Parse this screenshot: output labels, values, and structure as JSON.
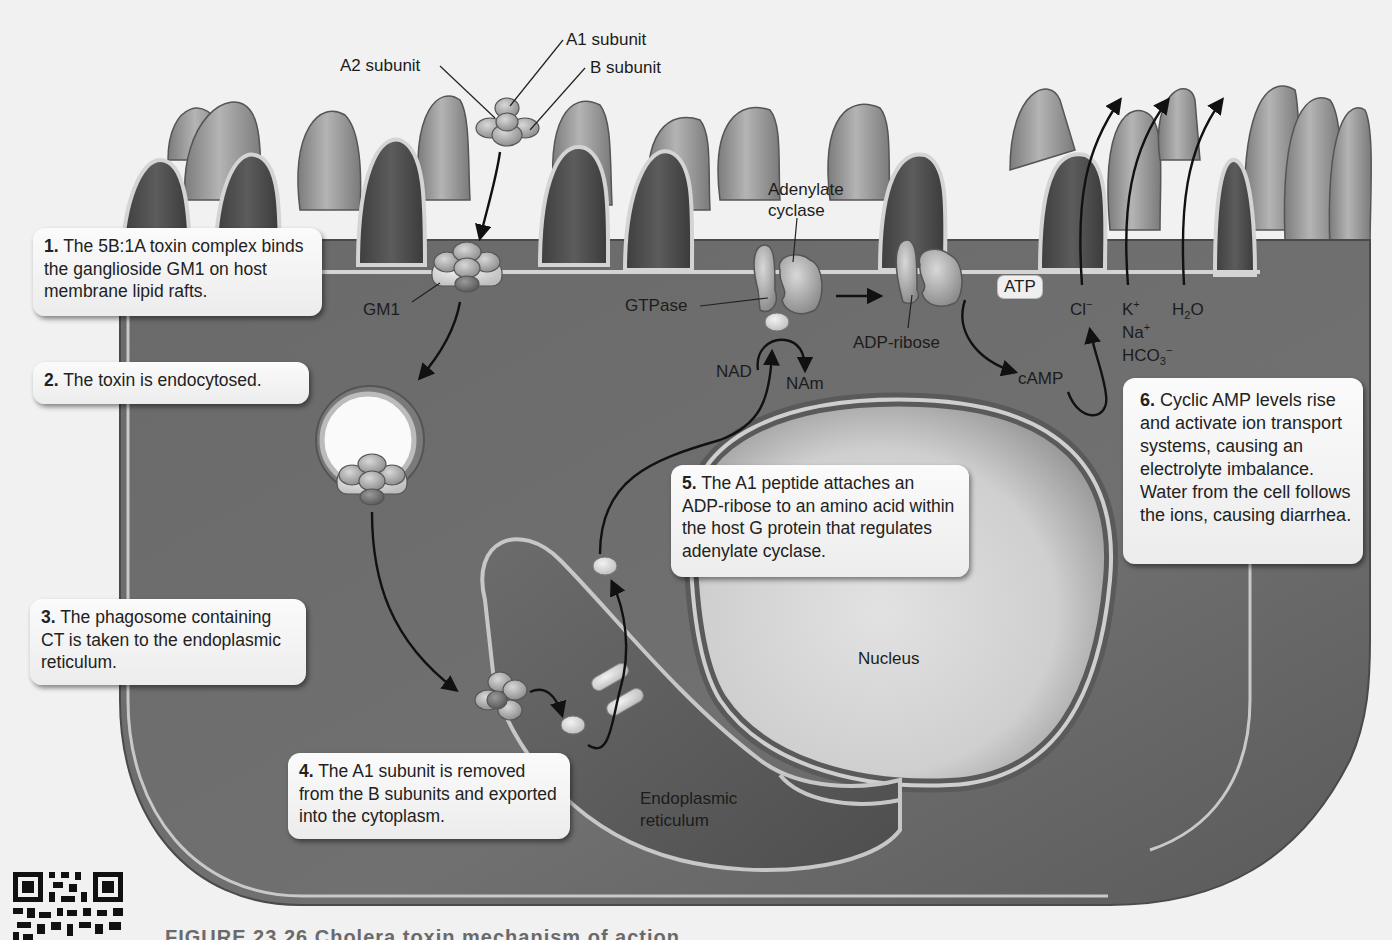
{
  "figure": {
    "colors": {
      "background": "#f1f1f1",
      "cell_body": "#6e6e6e",
      "microvilli": "#8c8c8c",
      "membrane_highlight": "#d8d8d8",
      "nucleus": "#d4d4d4",
      "er": "#5e5e5e",
      "callout_bg": "#f4f4f4",
      "arrow": "#111111"
    }
  },
  "labels": {
    "a1_subunit": "A1 subunit",
    "a2_subunit": "A2 subunit",
    "b_subunit": "B subunit",
    "gm1": "GM1",
    "adenylate_cyclase_line1": "Adenylate",
    "adenylate_cyclase_line2": "cyclase",
    "gtpase": "GTPase",
    "adp_ribose": "ADP-ribose",
    "atp": "ATP",
    "camp": "cAMP",
    "nad": "NAD",
    "nam": "NAm",
    "cl": "Cl",
    "cl_charge": "−",
    "k": "K",
    "k_charge": "+",
    "h2o_h": "H",
    "h2o_sub": "2",
    "h2o_o": "O",
    "na": "Na",
    "na_charge": "+",
    "hco3": "HCO",
    "hco3_sub": "3",
    "hco3_charge": "−",
    "nucleus": "Nucleus",
    "er_line1": "Endoplasmic",
    "er_line2": "reticulum"
  },
  "steps": [
    {
      "num": "1.",
      "text": "The 5B:1A toxin complex binds the ganglioside GM1 on host membrane lipid rafts."
    },
    {
      "num": "2.",
      "text": "The toxin is endocytosed."
    },
    {
      "num": "3.",
      "text": "The phagosome containing CT is taken to the endoplasmic reticulum."
    },
    {
      "num": "4.",
      "text": "The A1 subunit is removed from the B subunits and exported into the cytoplasm."
    },
    {
      "num": "5.",
      "text": "The A1 peptide attaches an ADP-ribose to an amino acid within the host G protein that regulates adenylate cyclase."
    },
    {
      "num": "6.",
      "text": "Cyclic AMP levels rise and activate ion transport systems, causing an electrolyte imbalance. Water from the cell follows the ions, causing diarrhea."
    }
  ],
  "caption": {
    "text": "FIGURE 23.26  Cholera toxin mechanism of action."
  }
}
